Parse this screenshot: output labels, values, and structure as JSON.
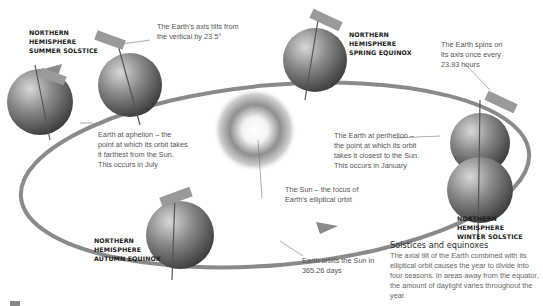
{
  "labels": {
    "summer_solstice": "NORTHERN\nHEMISPHERE\nSUMMER SOLSTICE",
    "spring_equinox": "NORTHERN\nHEMISPHERE\nSPRING EQUINOX",
    "autumn_equinox": "NORTHERN\nHEMISPHERE\nAUTUMN EQUINOX",
    "winter_solstice": "NORTHERN HEMISPHERE\nWINTER SOLSTICE"
  },
  "notes": {
    "axis_tilt": "The Earth's axis tilts from\nthe vertical by 23.5°",
    "spin": "The Earth spins on\nits axis once every\n23.93 hours",
    "aphelion": "Earth at aphelion – the\npoint at which its orbit takes\nit farthest from the Sun.\nThis occurs in July",
    "perihelion": "The Earth at perihelion –\nthe point at which its orbit\ntakes it closest to the Sun.\nThis occurs in January",
    "sun": "The Sun – the focus of\nEarth's elliptical orbit",
    "orbit": "Earth orbits the Sun in\n365.26 days"
  },
  "info_box": {
    "title": "Solstices and equinoxes",
    "body": "The axial tilt of the Earth combined with its elliptical orbit causes the year to divide into four seasons. In areas away from the equator, the amount of daylight varies throughout the year."
  },
  "colors": {
    "orbit": "#8a8a8a",
    "earth": "#6e6e6e",
    "text_bold": "#1a1a1a",
    "text_note": "#555555"
  }
}
